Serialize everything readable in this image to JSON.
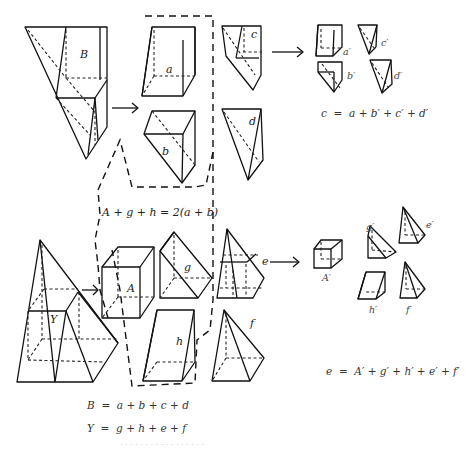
{
  "figure": {
    "solids": {
      "B": "B",
      "a": "a",
      "b": "b",
      "c": "c",
      "d": "d",
      "Y": "Y",
      "A": "A",
      "g": "g",
      "h": "h",
      "e": "e",
      "f": "f"
    },
    "pieces_c": {
      "a_prime": "a′",
      "b_prime": "b′",
      "c_prime": "c′",
      "d_prime": "d′"
    },
    "pieces_e": {
      "A_prime": "A′",
      "g_prime": "g′",
      "h_prime": "h′",
      "e_prime": "e′",
      "f_prime": "f′"
    },
    "equations": {
      "boxed": "A + g + h = 2(a + b)",
      "c_decomp": "c  =  a + b′ + c′ + d′",
      "e_decomp": "e  =  A′ + g′ + h′ + e′ + f′",
      "B_decomp": "B  =  a + b + c + d",
      "Y_decomp": "Y  =  g + h + e + f"
    },
    "caption": "· · · · · · · · · · · · · · · · ·"
  }
}
